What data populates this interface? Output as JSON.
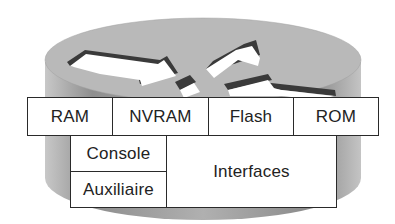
{
  "diagram": {
    "icon": "router-cylinder-icon",
    "colors": {
      "top_fill": "#b9b9b9",
      "body_fill": "#9a9a9a",
      "arrow_fill": "#ffffff",
      "arrow_shadow": "#3a3a3a",
      "box_border": "#2a2a2a",
      "text": "#222222"
    },
    "memory_row": [
      {
        "label": "RAM"
      },
      {
        "label": "NVRAM"
      },
      {
        "label": "Flash"
      },
      {
        "label": "ROM"
      }
    ],
    "ports": {
      "console": "Console",
      "auxiliary": "Auxiliaire",
      "interfaces": "Interfaces"
    }
  }
}
